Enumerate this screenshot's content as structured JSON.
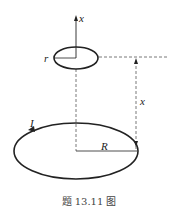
{
  "figure": {
    "axis_label": "x",
    "small_loop_radius_label": "r",
    "distance_label": "x",
    "current_label": "I",
    "large_loop_radius_label": "R",
    "caption": "题 13.11 图"
  },
  "colors": {
    "line": "#222222",
    "dashed": "#555555",
    "background": "#ffffff"
  }
}
